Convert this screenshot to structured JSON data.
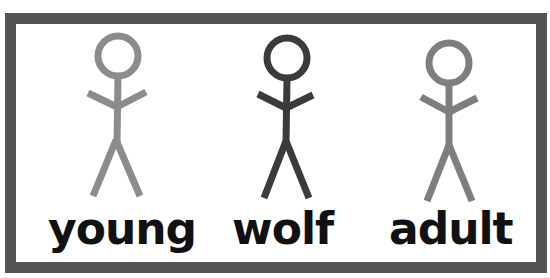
{
  "figures": [
    {
      "id": "young",
      "label": "young",
      "color": "#8c8c8c"
    },
    {
      "id": "wolf",
      "label": "wolf",
      "color": "#3b3b3b"
    },
    {
      "id": "adult",
      "label": "adult",
      "color": "#7e7e7e"
    }
  ],
  "frame": {
    "border_color": "#545454"
  }
}
